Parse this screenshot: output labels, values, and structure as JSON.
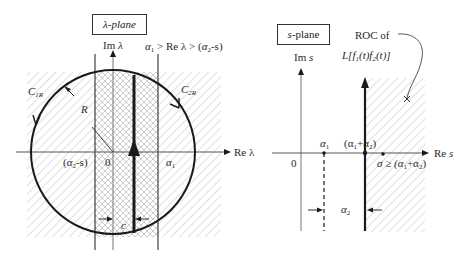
{
  "figure": {
    "left_panel": {
      "plane_label": "λ-plane",
      "imag_axis_label": "Im λ",
      "real_axis_label": "Re λ",
      "strip_condition": "α1 > Re λ > (α2-s)",
      "contour_left_label": "C1R",
      "contour_right_label": "C2R",
      "radius_label": "R",
      "tick_left": "(α2-s)",
      "tick_origin": "0",
      "tick_right": "α1",
      "width_label": "c"
    },
    "right_panel": {
      "plane_label": "s-plane",
      "imag_axis_label": "Im s",
      "real_axis_label": "Re s",
      "roc_label_line1": "ROC of",
      "roc_label_line2": "L[f1(t)f2(t)]",
      "tick_origin": "0",
      "tick_alpha1": "α1",
      "tick_sum": "(α1+α2)",
      "sigma_condition": "σ ≥ (α1+α2)",
      "gap_label": "α2",
      "pole_marker": "×"
    }
  },
  "labels": {
    "lambda_plane": "λ-plane",
    "im_lambda_a": "Im ",
    "im_lambda_b": "λ",
    "cond_a": "α",
    "cond_sub1": "1",
    "cond_b": " > Re λ > (",
    "cond_c": "α",
    "cond_sub2": "2",
    "cond_d": "-s)",
    "c1r_a": "C",
    "c1r_sub": "1R",
    "c2r_a": "C",
    "c2r_sub": "2R",
    "r": "R",
    "alpha2s_a": "(",
    "alpha2s_b": "α",
    "alpha2s_sub": "2",
    "alpha2s_c": "-s)",
    "zero_left": "0",
    "alpha1_left": "α",
    "alpha1_left_sub": "1",
    "re_lambda": "Re λ",
    "c": "c",
    "s_plane_a": "s",
    "s_plane_b": "-plane",
    "im_s_a": "Im ",
    "im_s_b": "s",
    "roc1": "ROC of",
    "roc2_a": "L[f",
    "roc2_s1": "1",
    "roc2_b": "(t)f",
    "roc2_s2": "2",
    "roc2_c": "(t)]",
    "zero_right": "0",
    "a1_right": "α",
    "a1_right_sub": "1",
    "sum_a": "(α",
    "sum_s1": "1",
    "sum_b": "+α",
    "sum_s2": "2",
    "sum_c": ")",
    "re_s_a": "Re ",
    "re_s_b": "s",
    "sigma_a": "σ ≥ (α",
    "sigma_s1": "1",
    "sigma_b": "+α",
    "sigma_s2": "2",
    "sigma_c": ")",
    "a2_gap": "α",
    "a2_gap_sub": "2"
  },
  "colors": {
    "line": "#1a1a1a",
    "thin_line": "#555555",
    "hatch": "#c8c8c8",
    "crosshatch": "#bdbdbd",
    "background": "#ffffff"
  }
}
